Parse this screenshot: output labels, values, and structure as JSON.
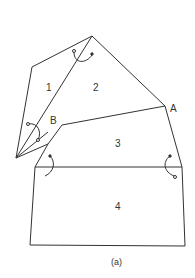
{
  "diagram": {
    "caption": "(a)",
    "regions": [
      {
        "id": "1",
        "label": "1"
      },
      {
        "id": "2",
        "label": "2"
      },
      {
        "id": "3",
        "label": "3"
      },
      {
        "id": "4",
        "label": "4"
      }
    ],
    "points": [
      {
        "id": "A",
        "label": "A"
      },
      {
        "id": "B",
        "label": "B"
      }
    ],
    "colors": {
      "stroke": "#333333",
      "background": "#ffffff"
    }
  }
}
